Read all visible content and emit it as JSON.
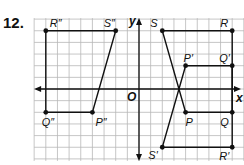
{
  "problem_number": "12.",
  "axes": {
    "x_label": "x",
    "y_label": "y",
    "origin_label": "O"
  },
  "grid": {
    "x_min": -9,
    "x_max": 9,
    "y_min": -6,
    "y_max": 6,
    "unit_px": 11.65,
    "origin_px": [
      139,
      89
    ]
  },
  "figures": [
    {
      "name": "original",
      "points": [
        {
          "label": "P",
          "x": 4,
          "y": -2,
          "lx": 0,
          "ly": 14
        },
        {
          "label": "Q",
          "x": 8,
          "y": -2,
          "lx": -12,
          "ly": 14
        },
        {
          "label": "R",
          "x": 8,
          "y": 5,
          "lx": -12,
          "ly": -4
        },
        {
          "label": "S",
          "x": 2,
          "y": 5,
          "lx": -12,
          "ly": -4
        }
      ]
    },
    {
      "name": "image-prime",
      "points": [
        {
          "label": "P′",
          "x": 4,
          "y": 2,
          "lx": -2,
          "ly": -4
        },
        {
          "label": "Q′",
          "x": 8,
          "y": 2,
          "lx": -13,
          "ly": -4
        },
        {
          "label": "R′",
          "x": 8,
          "y": -5,
          "lx": -13,
          "ly": 13
        },
        {
          "label": "S′",
          "x": 2,
          "y": -5,
          "lx": -14,
          "ly": 12
        }
      ]
    },
    {
      "name": "image-double-prime",
      "points": [
        {
          "label": "P″",
          "x": -4,
          "y": -2,
          "lx": 3,
          "ly": 14
        },
        {
          "label": "Q″",
          "x": -8,
          "y": -2,
          "lx": -4,
          "ly": 14
        },
        {
          "label": "R″",
          "x": -8,
          "y": 5,
          "lx": 4,
          "ly": -4
        },
        {
          "label": "S″",
          "x": -2,
          "y": 5,
          "lx": -12,
          "ly": -4
        }
      ]
    }
  ]
}
